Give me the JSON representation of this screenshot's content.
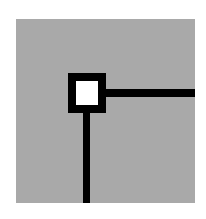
{
  "diagram": {
    "type": "corner-junction-icon",
    "colors": {
      "background": "#ffffff",
      "panel": "#a9a9a9",
      "lines": "#000000",
      "node_fill": "#ffffff"
    },
    "elements": [
      {
        "name": "panel",
        "shape": "rect"
      },
      {
        "name": "node",
        "shape": "hollow-square"
      },
      {
        "name": "horizontal-line",
        "direction": "right"
      },
      {
        "name": "vertical-line",
        "direction": "down"
      }
    ]
  }
}
